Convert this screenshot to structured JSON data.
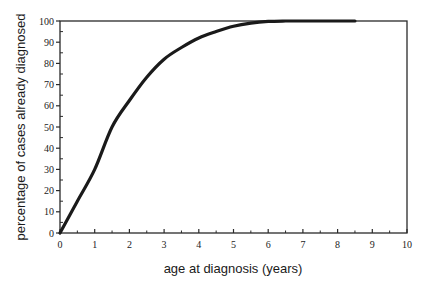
{
  "chart_data": {
    "type": "line",
    "title": "",
    "xlabel": "age at diagnosis (years)",
    "ylabel": "percentage of cases already diagnosed",
    "xlim": [
      0,
      10
    ],
    "ylim": [
      0,
      100
    ],
    "xticks": [
      0,
      1,
      2,
      3,
      4,
      5,
      6,
      7,
      8,
      9,
      10
    ],
    "yticks": [
      0,
      10,
      20,
      30,
      40,
      50,
      60,
      70,
      80,
      90,
      100
    ],
    "grid": false,
    "legend": null,
    "series": [
      {
        "name": "cumulative percentage diagnosed",
        "color": "#1a1a1a",
        "x": [
          0,
          0.5,
          1,
          1.5,
          2,
          2.5,
          3,
          3.5,
          4,
          4.5,
          5,
          5.5,
          6,
          6.5,
          7,
          7.5,
          8,
          8.5
        ],
        "y": [
          0,
          15,
          30,
          50,
          62.5,
          73.5,
          82,
          87.5,
          92,
          95,
          97.5,
          99,
          99.8,
          100,
          100,
          100,
          100,
          100
        ]
      }
    ]
  }
}
